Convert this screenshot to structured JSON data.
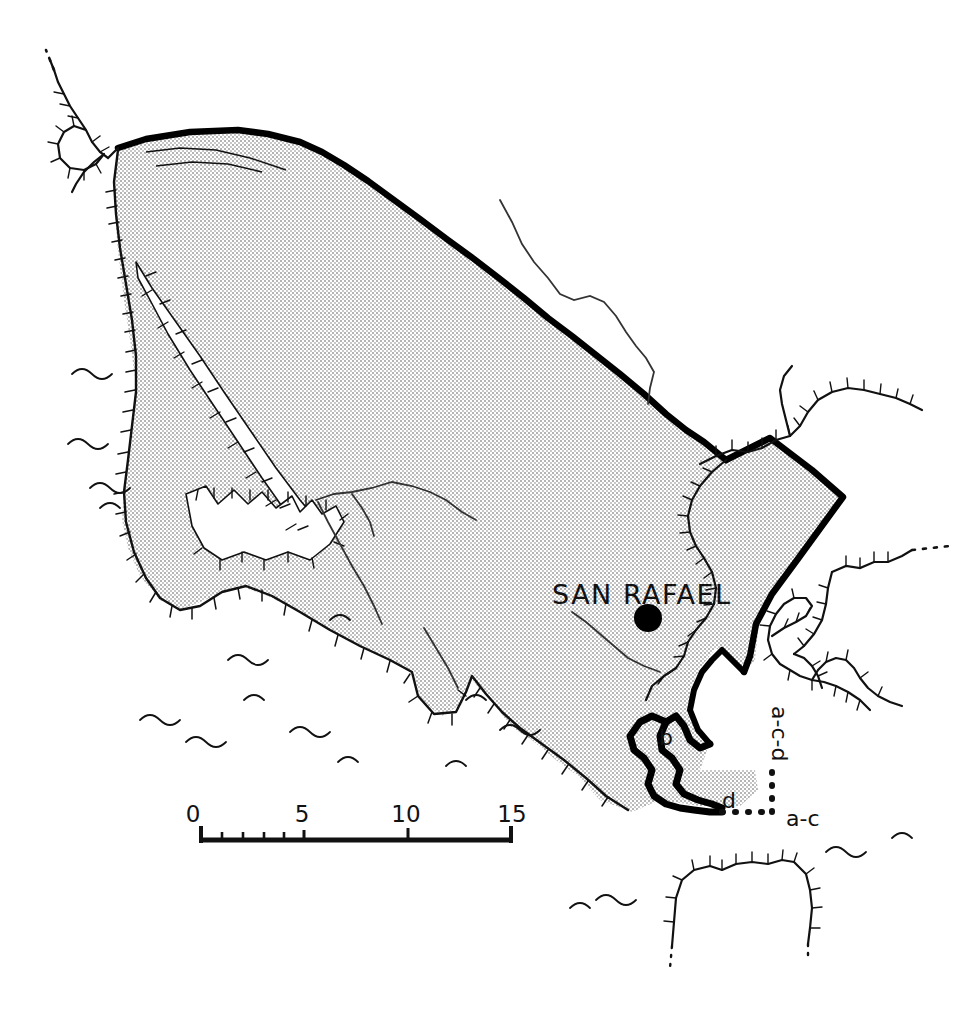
{
  "map": {
    "title_visible": false,
    "type": "historical-hand-drawn-county-map",
    "background_color": "#ffffff",
    "land_fill_color": "#d9d9d9",
    "ink_color": "#111111",
    "boundary_color": "#000000",
    "places": [
      {
        "name": "SAN RAFAEL",
        "label": "SAN RAFAEL",
        "marker": "filled-circle",
        "x": 648,
        "y": 618
      }
    ],
    "annotations": [
      {
        "id": "b",
        "label": "b",
        "x": 664,
        "y": 737,
        "rotation": 0
      },
      {
        "id": "d",
        "label": "d",
        "x": 727,
        "y": 800,
        "rotation": 0
      },
      {
        "id": "a-c-d",
        "label": "a-c-d",
        "x": 772,
        "y": 718,
        "rotation": 90
      },
      {
        "id": "a-c",
        "label": "a-c",
        "x": 788,
        "y": 818,
        "rotation": 0
      }
    ],
    "scale_bar": {
      "units_label": "",
      "ticks": [
        {
          "label": "0",
          "value": 0,
          "x": 200
        },
        {
          "label": "5",
          "value": 5,
          "x": 304
        },
        {
          "label": "10",
          "value": 10,
          "x": 408
        },
        {
          "label": "15",
          "value": 15,
          "x": 512
        }
      ],
      "minor_tick_values": [
        1,
        2,
        3,
        4
      ],
      "baseline_y": 840,
      "x_start": 200,
      "x_end": 512
    },
    "legend_items": [],
    "features": {
      "coastline_style": "hachured",
      "interior_lines": "rivers",
      "ocean_symbol": "wave-glyphs",
      "dashed_segment": "dotted-line-boundary"
    }
  }
}
